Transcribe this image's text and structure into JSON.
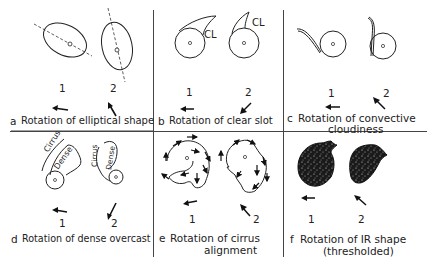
{
  "figure": {
    "panels": [
      {
        "id": "a",
        "letter": "a",
        "caption": "Rotation of elliptical shape",
        "caption_line2": "",
        "labels": [
          "1",
          "2"
        ],
        "arrows": [
          "left",
          "up-left"
        ]
      },
      {
        "id": "b",
        "letter": "b",
        "caption": "Rotation of clear slot",
        "caption_line2": "",
        "labels": [
          "1",
          "2"
        ],
        "arrows": [
          "left",
          "down-left"
        ],
        "annotations": [
          "CL",
          "CL"
        ]
      },
      {
        "id": "c",
        "letter": "c",
        "caption": "Rotation of convective",
        "caption_line2": "cloudiness",
        "labels": [
          "1",
          "2"
        ],
        "arrows": [
          "left",
          "up-left"
        ]
      },
      {
        "id": "d",
        "letter": "d",
        "caption": "Rotation of dense overcast",
        "caption_line2": "",
        "labels": [
          "1",
          "2"
        ],
        "arrows": [
          "left",
          "down-left"
        ],
        "annotations": [
          "Cirrus",
          "Dense",
          "Cirrus",
          "Dense"
        ]
      },
      {
        "id": "e",
        "letter": "e",
        "caption": "Rotation of cirrus",
        "caption_line2": "alignment",
        "labels": [
          "1",
          "2"
        ],
        "arrows": [
          "left",
          "up-left"
        ]
      },
      {
        "id": "f",
        "letter": "f",
        "caption": "Rotation of IR shape",
        "caption_line2": "(thresholded)",
        "labels": [
          "1",
          "2"
        ],
        "arrows": [
          "left",
          "up-left"
        ]
      }
    ]
  },
  "colors": {
    "ink": "#222222",
    "background": "#ffffff",
    "fill_dark": "#1a1a1a"
  }
}
